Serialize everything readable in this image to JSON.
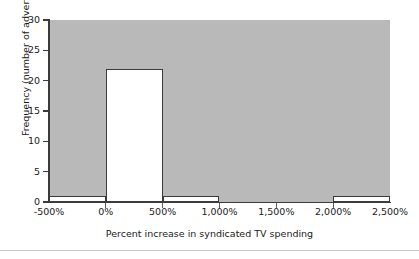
{
  "chart_data": {
    "type": "bar",
    "title": "",
    "subtitle": "",
    "xlabel": "Percent increase in syndicated TV spending",
    "ylabel": "Frequency (number of advertisers)",
    "categories": [
      "-500% to 0%",
      "0% to 500%",
      "500% to 1,000%",
      "1,000% to 1,500%",
      "1,500% to 2,000%",
      "2,000% to 2,500%"
    ],
    "bin_edges": [
      -500,
      0,
      500,
      1000,
      1500,
      2000,
      2500
    ],
    "bin_width": 500,
    "values": [
      1,
      22,
      1,
      0,
      0,
      1
    ],
    "xlim": [
      -500,
      2500
    ],
    "ylim": [
      0,
      30
    ],
    "xticks": [
      -500,
      0,
      500,
      1000,
      1500,
      2000,
      2500
    ],
    "xticklabels": [
      "-500%",
      "0%",
      "500%",
      "1,000%",
      "1,500%",
      "2,000%",
      "2,500%"
    ],
    "yticks": [
      0,
      5,
      10,
      15,
      20,
      25,
      30
    ],
    "yticklabels": [
      "0",
      "5",
      "10",
      "15",
      "20",
      "25",
      "30"
    ],
    "grid": false,
    "legend": "none",
    "bar_fill_color": "#ffffff",
    "bar_edge_color": "#3b3b3b",
    "plot_background_color": "#b9b9b9",
    "figure_background_color": "#ffffff",
    "axis_color": "#3b3b3b",
    "text_color": "#1a1a1a"
  }
}
